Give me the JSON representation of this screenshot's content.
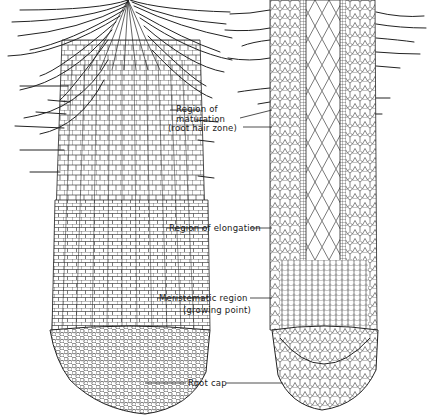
{
  "figure": {
    "type": "botanical longitudinal-section illustration of a root tip",
    "panels": [
      {
        "id": "left",
        "description": "external view of root tip with root hairs"
      },
      {
        "id": "right",
        "description": "longitudinal section of root tip showing cell layers"
      }
    ],
    "labels": [
      {
        "id": "maturation",
        "lines": [
          "Region of",
          "maturation",
          "(root hair zone)"
        ]
      },
      {
        "id": "elongation",
        "lines": [
          "Region of elongation"
        ]
      },
      {
        "id": "meristematic",
        "lines": [
          "Meristematic region",
          "(growing point)"
        ]
      },
      {
        "id": "rootcap",
        "lines": [
          "Root cap"
        ]
      }
    ],
    "colors": {
      "ink": "#1a1a1a",
      "paper": "#ffffff"
    }
  }
}
